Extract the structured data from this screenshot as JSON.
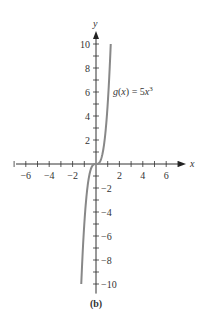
{
  "chart_data": {
    "type": "line",
    "title": "",
    "function_label": "g(x) = 5x³",
    "function_label_parts": {
      "lhs": "g(x) = 5x",
      "exp": "3"
    },
    "xlabel": "x",
    "ylabel": "y",
    "xlim": [
      -7,
      7
    ],
    "ylim": [
      -10.5,
      10.5
    ],
    "x_ticks": [
      -6,
      -4,
      -2,
      2,
      4,
      6
    ],
    "y_ticks": [
      -10,
      -8,
      -6,
      -4,
      -2,
      2,
      4,
      6,
      8,
      10
    ],
    "series": [
      {
        "name": "g(x) = 5x^3",
        "x": [
          -1.26,
          -1.2,
          -1.0,
          -0.8,
          -0.6,
          -0.4,
          -0.2,
          0,
          0.2,
          0.4,
          0.6,
          0.8,
          1.0,
          1.2,
          1.26
        ],
        "y": [
          -10,
          -8.64,
          -5,
          -2.56,
          -1.08,
          -0.32,
          -0.04,
          0,
          0.04,
          0.32,
          1.08,
          2.56,
          5,
          8.64,
          10
        ]
      }
    ],
    "grid": false,
    "caption": "(b)",
    "curve_color": "#888888"
  }
}
